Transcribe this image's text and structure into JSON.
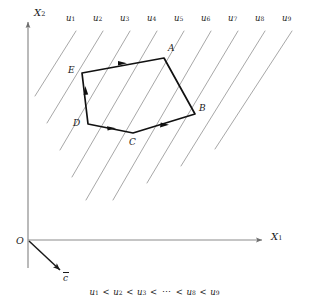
{
  "figure": {
    "type": "linear-programming-objective-contour-diagram",
    "background_color": "#ffffff",
    "axis_color": "#8c8c8c",
    "contour_color": "#9a9a9a",
    "polygon_color": "#1a1a1a",
    "label_color": "#1a1a1a"
  },
  "axes": {
    "origin_label": "O",
    "x_axis_label": "X",
    "x_axis_subscript": "1",
    "y_axis_label": "X",
    "y_axis_subscript": "2",
    "origin_px": [
      28,
      240
    ],
    "x_axis_end_px": [
      268,
      240
    ],
    "y_axis_end_px": [
      28,
      18
    ]
  },
  "gradient_vector": {
    "label": "c",
    "has_overbar": true,
    "start_px": [
      28,
      240
    ],
    "end_px": [
      62,
      272
    ]
  },
  "contour_lines": {
    "count": 9,
    "slope_description": "45-degree lines rising to the right",
    "labels": [
      "u",
      "u",
      "u",
      "u",
      "u",
      "u",
      "u",
      "u",
      "u"
    ],
    "subscripts": [
      "1",
      "2",
      "3",
      "4",
      "5",
      "6",
      "7",
      "8",
      "9"
    ],
    "label_positions_px": [
      [
        70,
        19
      ],
      [
        97,
        19
      ],
      [
        124,
        19
      ],
      [
        151,
        19
      ],
      [
        178,
        19
      ],
      [
        205,
        19
      ],
      [
        232,
        19
      ],
      [
        259,
        19
      ],
      [
        286,
        19
      ]
    ]
  },
  "polygon": {
    "name": "feasible-region",
    "vertex_count": 5,
    "vertices": [
      {
        "label": "A",
        "point_px": [
          164,
          58
        ],
        "label_px": [
          168,
          50
        ]
      },
      {
        "label": "B",
        "point_px": [
          195,
          114
        ],
        "label_px": [
          199,
          110
        ]
      },
      {
        "label": "C",
        "point_px": [
          133,
          133
        ],
        "label_px": [
          130,
          144
        ]
      },
      {
        "label": "D",
        "point_px": [
          88,
          124
        ],
        "label_px": [
          74,
          124
        ]
      },
      {
        "label": "E",
        "point_px": [
          82,
          73
        ],
        "label_px": [
          69,
          72
        ]
      }
    ],
    "edge_arrow_directions": [
      "E-to-A",
      "D-to-E",
      "D-to-C",
      "C-to-B"
    ]
  },
  "caption": {
    "terms": [
      "u",
      "u",
      "u",
      "u",
      "u"
    ],
    "subscripts": [
      "1",
      "2",
      "3",
      "8",
      "9"
    ],
    "operator": "<",
    "ellipsis": "⋯",
    "text": "u1 < u2 < u3 < ⋯ < u8 < u9"
  }
}
